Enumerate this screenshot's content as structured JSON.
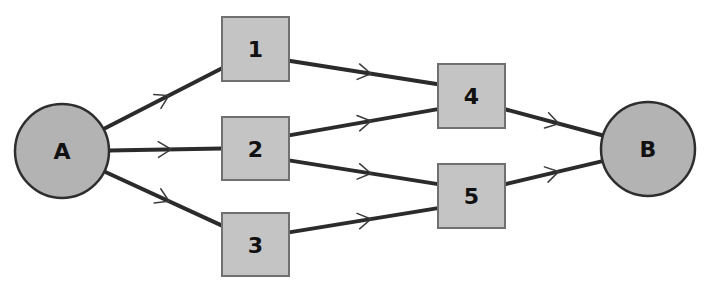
{
  "diagram": {
    "type": "directed-network",
    "colors": {
      "edge": "#2b2b2b",
      "circle_fill": "#b3b3b3",
      "box_fill": "#c4c4c4",
      "box_stroke": "#707070",
      "background": "#ffffff"
    },
    "nodes": [
      {
        "id": "A",
        "label": "A",
        "shape": "circle",
        "cx": 62,
        "cy": 151,
        "r": 47
      },
      {
        "id": "1",
        "label": "1",
        "shape": "box",
        "x": 222,
        "y": 17,
        "w": 67,
        "h": 64
      },
      {
        "id": "2",
        "label": "2",
        "shape": "box",
        "x": 222,
        "y": 117,
        "w": 67,
        "h": 63
      },
      {
        "id": "3",
        "label": "3",
        "shape": "box",
        "x": 222,
        "y": 213,
        "w": 67,
        "h": 63
      },
      {
        "id": "4",
        "label": "4",
        "shape": "box",
        "x": 438,
        "y": 64,
        "w": 67,
        "h": 64
      },
      {
        "id": "5",
        "label": "5",
        "shape": "box",
        "x": 438,
        "y": 164,
        "w": 67,
        "h": 64
      },
      {
        "id": "B",
        "label": "B",
        "shape": "circle",
        "cx": 648,
        "cy": 149,
        "r": 47
      }
    ],
    "edges": [
      {
        "from": "A",
        "to": "1"
      },
      {
        "from": "A",
        "to": "2"
      },
      {
        "from": "A",
        "to": "3"
      },
      {
        "from": "1",
        "to": "4"
      },
      {
        "from": "2",
        "to": "4"
      },
      {
        "from": "2",
        "to": "5"
      },
      {
        "from": "3",
        "to": "5"
      },
      {
        "from": "4",
        "to": "B"
      },
      {
        "from": "5",
        "to": "B"
      }
    ]
  }
}
